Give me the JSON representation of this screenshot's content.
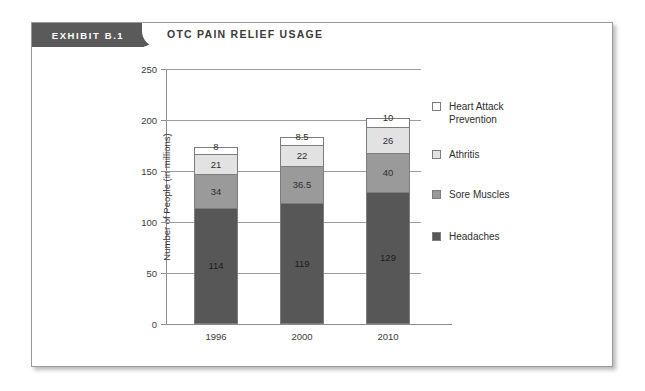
{
  "exhibit": {
    "tag": "EXHIBIT  B.1",
    "title": "OTC PAIN RELIEF USAGE"
  },
  "legend": {
    "items": [
      {
        "label": "Heart Attack\nPrevention",
        "color": "#ffffff",
        "key": "heart-attack-prevention"
      },
      {
        "label": "Athritis",
        "color": "#e2e2e2",
        "key": "athritis"
      },
      {
        "label": "Sore Muscles",
        "color": "#9a9a9a",
        "key": "sore-muscles"
      },
      {
        "label": "Headaches",
        "color": "#575757",
        "key": "headaches"
      }
    ]
  },
  "chart_data": {
    "type": "bar",
    "stacked": true,
    "title": "OTC PAIN RELIEF USAGE",
    "xlabel": "",
    "ylabel": "Number of People (in millions)",
    "categories": [
      "1996",
      "2000",
      "2010"
    ],
    "ylim": [
      0,
      250
    ],
    "yticks": [
      0,
      50,
      100,
      150,
      200,
      250
    ],
    "ytick_labels": [
      "0",
      "50",
      "100",
      "150",
      "200",
      "250"
    ],
    "grid": true,
    "legend_position": "right",
    "series": [
      {
        "name": "Headaches",
        "color": "#575757",
        "values": [
          114,
          119,
          129
        ],
        "labels": [
          "114",
          "119",
          "129"
        ]
      },
      {
        "name": "Sore Muscles",
        "color": "#9a9a9a",
        "values": [
          34,
          36.5,
          40
        ],
        "labels": [
          "34",
          "36.5",
          "40"
        ]
      },
      {
        "name": "Athritis",
        "color": "#e2e2e2",
        "values": [
          21,
          22,
          26
        ],
        "labels": [
          "21",
          "22",
          "26"
        ]
      },
      {
        "name": "Heart Attack Prevention",
        "color": "#ffffff",
        "values": [
          8,
          8.5,
          10
        ],
        "labels": [
          "8",
          "8.5",
          "10"
        ]
      }
    ],
    "totals": [
      177,
      186,
      205
    ]
  }
}
